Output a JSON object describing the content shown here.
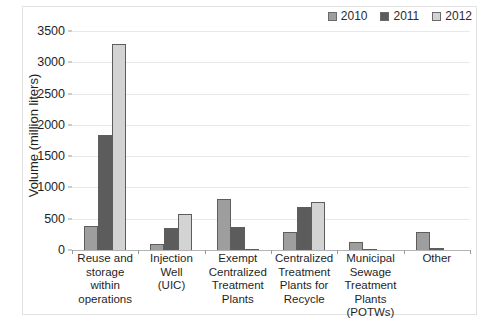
{
  "chart_data": {
    "type": "bar",
    "title": "",
    "xlabel": "",
    "ylabel": "Volume (million liters)",
    "ylim": [
      0,
      3500
    ],
    "ytick_labels": [
      "3500",
      "3000",
      "2500",
      "2000",
      "1500",
      "1000",
      "500",
      "0"
    ],
    "ytick_values": [
      3500,
      3000,
      2500,
      2000,
      1500,
      1000,
      500,
      0
    ],
    "grid": "horizontal",
    "legend_position": "top-right",
    "categories": [
      "Reuse and storage within operations",
      "Injection Well (UIC)",
      "Exempt Centralized Treatment Plants",
      "Centralized Treatment Plants for Recycle",
      "Municipal Sewage Treatment Plants (POTWs)",
      "Other"
    ],
    "category_lines": [
      [
        "Reuse and",
        "storage within",
        "operations"
      ],
      [
        "Injection Well",
        "(UIC)"
      ],
      [
        "Exempt",
        "Centralized",
        "Treatment",
        "Plants"
      ],
      [
        "Centralized",
        "Treatment",
        "Plants for",
        "Recycle"
      ],
      [
        "Municipal",
        "Sewage",
        "Treatment",
        "Plants",
        "(POTWs)"
      ],
      [
        "Other"
      ]
    ],
    "series": [
      {
        "name": "2010",
        "color": "#9e9e9e",
        "values": [
          390,
          90,
          820,
          280,
          130,
          290
        ]
      },
      {
        "name": "2011",
        "color": "#5c5c5c",
        "values": [
          1840,
          350,
          370,
          680,
          20,
          30
        ]
      },
      {
        "name": "2012",
        "color": "#d3d3d3",
        "values": [
          3290,
          580,
          20,
          770,
          0,
          0
        ]
      }
    ]
  },
  "legend": {
    "items": [
      {
        "label": "2010",
        "color": "#9e9e9e"
      },
      {
        "label": "2011",
        "color": "#5c5c5c"
      },
      {
        "label": "2012",
        "color": "#d3d3d3"
      }
    ]
  },
  "axis": {
    "y_title": "Volume (million liters)"
  }
}
